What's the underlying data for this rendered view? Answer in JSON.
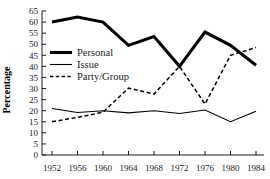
{
  "chart_data": {
    "type": "line",
    "title": "",
    "xlabel": "",
    "ylabel": "Percentage",
    "categories": [
      "1952",
      "1956",
      "1960",
      "1964",
      "1968",
      "1972",
      "1976",
      "1980",
      "1984"
    ],
    "xticklabels": [
      "1952",
      "1956",
      "1960",
      "1964",
      "1968",
      "1972",
      "1976",
      "1980",
      "1984"
    ],
    "yticklabels": [
      "0",
      "5",
      "10",
      "15",
      "20",
      "25",
      "30",
      "35",
      "40",
      "45",
      "50",
      "55",
      "60",
      "65"
    ],
    "ytickvalues": [
      0,
      5,
      10,
      15,
      20,
      25,
      30,
      35,
      40,
      45,
      50,
      55,
      60,
      65
    ],
    "ylim": [
      0,
      65
    ],
    "grid": false,
    "legend_position": "upper-left-inside",
    "series": [
      {
        "name": "Personal",
        "style": "thick-solid",
        "color": "#000000",
        "values": [
          60.0,
          62.3,
          60.0,
          49.5,
          53.5,
          40.0,
          55.5,
          49.5,
          40.5
        ]
      },
      {
        "name": "Issue",
        "style": "thin-solid",
        "color": "#000000",
        "values": [
          21.0,
          19.2,
          20.0,
          19.0,
          20.0,
          18.7,
          20.3,
          15.0,
          19.8
        ]
      },
      {
        "name": "Party/Group",
        "style": "dashed",
        "color": "#000000",
        "values": [
          15.0,
          17.0,
          19.3,
          30.2,
          27.5,
          40.0,
          23.0,
          45.0,
          48.5
        ]
      }
    ]
  },
  "legend": {
    "items": [
      {
        "label": "Personal"
      },
      {
        "label": "Issue"
      },
      {
        "label": "Party/Group"
      }
    ]
  },
  "axes": {
    "y_title": "Percentage"
  }
}
